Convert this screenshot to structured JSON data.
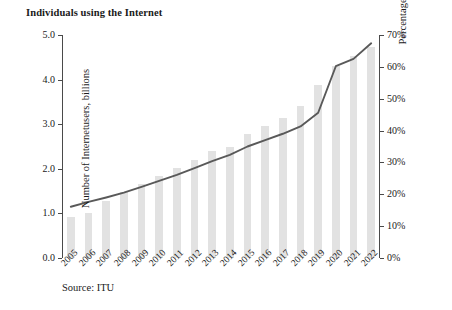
{
  "chart_data": {
    "type": "bar",
    "title": "Individuals using the Internet",
    "xlabel": "",
    "ylabel": "Number of Internetusers, billions",
    "y2label": "Percentage of population",
    "source": "Source: ITU",
    "grid": false,
    "legend": "none",
    "ylim": [
      0,
      5
    ],
    "y2lim": [
      0,
      70
    ],
    "ytick_labels": [
      "0.0",
      "1.0",
      "2.0",
      "3.0",
      "4.0",
      "5.0"
    ],
    "ytick_values": [
      0,
      1,
      2,
      3,
      4,
      5
    ],
    "y2tick_labels": [
      "0%",
      "10%",
      "20%",
      "30%",
      "40%",
      "50%",
      "60%",
      "70%"
    ],
    "y2tick_values": [
      0,
      10,
      20,
      30,
      40,
      50,
      60,
      70
    ],
    "categories": [
      "2005",
      "2006",
      "2007",
      "2008",
      "2009",
      "2010",
      "2011",
      "2012",
      "2013",
      "2014",
      "2015",
      "2016",
      "2017",
      "2018",
      "2019",
      "2020",
      "2021",
      "2022"
    ],
    "series": [
      {
        "name": "Number of Internetusers, billions",
        "type": "bar",
        "axis": "left",
        "color": "#e2e2e2",
        "values": [
          0.93,
          1.02,
          1.28,
          1.47,
          1.66,
          1.84,
          2.02,
          2.19,
          2.39,
          2.49,
          2.79,
          2.95,
          3.13,
          3.4,
          3.88,
          4.31,
          4.53,
          4.74
        ]
      },
      {
        "name": "Percentage of population",
        "type": "line",
        "axis": "right",
        "color": "#595959",
        "values": [
          16.1,
          17.6,
          19.0,
          20.5,
          22.3,
          24.2,
          26.1,
          28.2,
          30.4,
          32.4,
          35.0,
          37.0,
          39.0,
          41.3,
          45.6,
          60.2,
          62.5,
          67.4
        ]
      }
    ]
  }
}
